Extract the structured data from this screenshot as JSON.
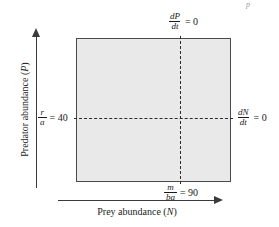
{
  "figure": {
    "type": "phase-plane-diagram",
    "plot_fill_color": "#e9e9e9",
    "line_color": "#3a3a3a",
    "dash_color": "#2b2b2b"
  },
  "axes": {
    "y_title": "Predator abundance (P)",
    "y_title_plain": "Predator abundance",
    "y_variable": "P",
    "x_title": "Prey abundance (N)",
    "x_title_plain": "Prey abundance",
    "x_variable": "N"
  },
  "isoclines": {
    "predator": {
      "label_numerator": "dP",
      "label_denominator": "dt",
      "label_rest": "= 0",
      "orientation": "vertical",
      "position_label": "top"
    },
    "prey": {
      "label_numerator": "dN",
      "label_denominator": "dt",
      "label_rest": "= 0",
      "orientation": "horizontal",
      "position_label": "right"
    }
  },
  "tick_labels": {
    "y_equilibrium": {
      "numerator": "r",
      "denominator": "a",
      "rest": "= 40",
      "value": 40
    },
    "x_equilibrium": {
      "numerator": "m",
      "denominator": "ba",
      "rest": "= 90",
      "value": 90
    }
  },
  "artifact": {
    "text": "p"
  },
  "chart_data": {
    "type": "line",
    "xlabel": "Prey abundance (N)",
    "ylabel": "Predator abundance (P)",
    "series": [
      {
        "name": "dP/dt = 0",
        "orientation": "vertical",
        "x_value": 90,
        "style": "dashed"
      },
      {
        "name": "dN/dt = 0",
        "orientation": "horizontal",
        "y_value": 40,
        "style": "dashed"
      }
    ],
    "equilibrium_point": {
      "N": 90,
      "P": 40
    },
    "grid": false,
    "legend": "none"
  }
}
